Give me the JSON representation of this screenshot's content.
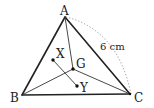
{
  "diagram": {
    "points": {
      "A": {
        "label": "A"
      },
      "B": {
        "label": "B"
      },
      "C": {
        "label": "C"
      },
      "G": {
        "label": "G"
      },
      "X": {
        "label": "X"
      },
      "Y": {
        "label": "Y"
      }
    },
    "measurement": {
      "side": "AC",
      "label": "6 cm"
    },
    "segments": [
      "AB",
      "BC",
      "CA",
      "AG",
      "BG",
      "CG",
      "XY"
    ]
  }
}
